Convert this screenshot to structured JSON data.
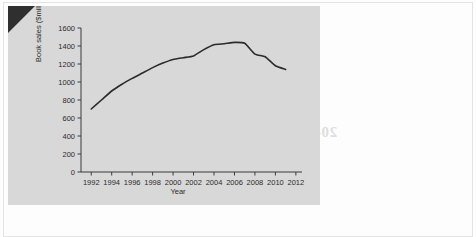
{
  "page": {
    "ghost_text": {
      "line1": "then you can then make a 100 sales from",
      "line2": "increasing. The number of books sold",
      "line3": "and sales two thousand million books",
      "line4": "that are to measure the they say and",
      "line5": "books and markets are ours and this",
      "heading": "20-23 AND THE AVERAGES",
      "bottom": "sales of books and sales and the market"
    }
  },
  "chart_data": {
    "type": "line",
    "title": "",
    "xlabel": "Year",
    "ylabel": "Book sales ($millions)",
    "xlim": [
      1991,
      2012.6
    ],
    "ylim": [
      0,
      1650
    ],
    "grid": false,
    "legend": "none",
    "xticks": [
      1992,
      1994,
      1996,
      1998,
      2000,
      2002,
      2004,
      2006,
      2008,
      2010,
      2012
    ],
    "xtick_labels": [
      "1992",
      "1994",
      "1996",
      "1998",
      "2000",
      "2002",
      "2004",
      "2006",
      "2008",
      "2010",
      "2012"
    ],
    "yticks": [
      0,
      200,
      400,
      600,
      800,
      1000,
      1200,
      1400,
      1600
    ],
    "ytick_labels": [
      "0",
      "200",
      "400",
      "600",
      "800",
      "1000",
      "1200",
      "1400",
      "1600"
    ],
    "line_color": "#2b2b2b",
    "x": [
      1992,
      1993,
      1994,
      1995,
      1996,
      1997,
      1998,
      1999,
      2000,
      2001,
      2002,
      2003,
      2004,
      2005,
      2006,
      2007,
      2008,
      2009,
      2010,
      2011
    ],
    "values": [
      700,
      800,
      900,
      975,
      1040,
      1100,
      1160,
      1210,
      1250,
      1270,
      1290,
      1360,
      1415,
      1425,
      1440,
      1430,
      1310,
      1280,
      1180,
      1140
    ],
    "series": [
      {
        "name": "Book sales",
        "values": [
          700,
          800,
          900,
          975,
          1040,
          1100,
          1160,
          1210,
          1250,
          1270,
          1290,
          1360,
          1415,
          1425,
          1440,
          1430,
          1310,
          1280,
          1180,
          1140
        ]
      }
    ]
  }
}
